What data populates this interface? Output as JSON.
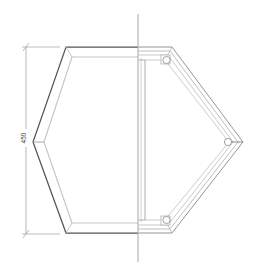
{
  "drawing": {
    "title": "Hexagonal frame elevation",
    "view_type": "half-section elevation",
    "background_color": "#ffffff"
  },
  "dimensions": [
    {
      "id": "overall-height",
      "label": "450",
      "orientation": "vertical",
      "position": "left",
      "text_color": "#3a3a3a",
      "line_color": "#9a9a9a"
    }
  ],
  "centerline": {
    "orientation": "vertical",
    "color": "#b0b0b0"
  },
  "geometry": {
    "outer_hexagon": {
      "stroke": "#555555",
      "vertices_note": "flat-top hexagon, pointed left and right"
    },
    "inner_hexagon": {
      "stroke": "#b5b5b5"
    },
    "section_frame": {
      "stroke": "#9a9a9a",
      "profile_lines": 3
    }
  },
  "fasteners": [
    {
      "id": "bolt-top-right",
      "shape": "circle"
    },
    {
      "id": "bolt-right-vertex",
      "shape": "circle"
    },
    {
      "id": "bolt-bottom-right",
      "shape": "circle"
    }
  ],
  "colors": {
    "outline_dark": "#555555",
    "outline_light": "#b5b5b5",
    "frame_line": "#9a9a9a",
    "dim_line": "#9a9a9a",
    "centerline": "#b0b0b0",
    "text": "#3a3a3a"
  }
}
